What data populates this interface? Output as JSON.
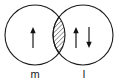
{
  "diagram": {
    "type": "orbital-overlap",
    "background_color": "#ffffff",
    "stroke_color": "#1a1a1a",
    "arrow_color": "#111111",
    "canvas": {
      "width": 120,
      "height": 82
    },
    "circles": [
      {
        "id": "left-orbital",
        "name": "m",
        "cx": 35,
        "cy": 35,
        "r": 30,
        "label": "m",
        "label_x": 35,
        "label_y": 78,
        "electron_count": 1
      },
      {
        "id": "right-orbital",
        "name": "l",
        "cx": 83,
        "cy": 35,
        "r": 30,
        "label": "l",
        "label_x": 84,
        "label_y": 78,
        "electron_count": 2
      }
    ],
    "overlap": {
      "id": "overlap-lens",
      "name": "hatched-overlap-region",
      "fill_pattern": "diagonal-hatch",
      "hatch_angle_deg": 45,
      "hatch_spacing": 2.2,
      "hatch_color": "#1a1a1a"
    },
    "arrows": [
      {
        "id": "left-spin-up",
        "orbital": "m",
        "direction": "up",
        "x": 33,
        "top": 28,
        "bottom": 48
      },
      {
        "id": "right-spin-up",
        "orbital": "l",
        "direction": "up",
        "x": 76,
        "top": 28,
        "bottom": 48
      },
      {
        "id": "right-spin-down",
        "orbital": "l",
        "direction": "down",
        "x": 89,
        "top": 28,
        "bottom": 48
      }
    ],
    "labels": {
      "left": "m",
      "right": "l"
    }
  }
}
